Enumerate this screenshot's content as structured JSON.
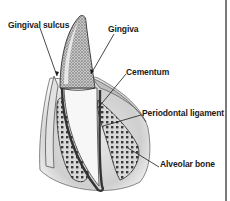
{
  "diagram": {
    "labels": {
      "gingival_sulcus": "Gingival sulcus",
      "gingiva": "Gingiva",
      "cementum": "Cementum",
      "periodontal_ligament": "Periodontal ligament",
      "alveolar_bone": "Alveolar bone"
    },
    "colors": {
      "line": "#1a1a1a",
      "frame": "#7a7a7a",
      "bone_dots": "#3a3a3a",
      "gum_shade": "#bdbdbd"
    }
  }
}
